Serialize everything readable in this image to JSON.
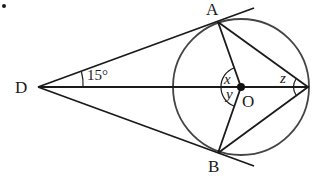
{
  "diagram": {
    "type": "geometry",
    "stroke_color": "#1a1a1a",
    "circle_color": "#444444",
    "points": {
      "D": {
        "label": "D",
        "x": 38,
        "y": 87
      },
      "A": {
        "label": "A",
        "x": 218,
        "y": 22
      },
      "B": {
        "label": "B",
        "x": 218,
        "y": 153
      },
      "O": {
        "label": "O",
        "x": 241,
        "y": 87
      },
      "C": {
        "label": "",
        "x": 308,
        "y": 87
      }
    },
    "circle": {
      "center": "O",
      "radius": 68
    },
    "angles": {
      "ADO": {
        "label": "15°",
        "value": 15
      },
      "AOD": {
        "label": "x"
      },
      "BOD": {
        "label": "y"
      },
      "ACO": {
        "label": "z"
      }
    },
    "bullet": "•"
  }
}
